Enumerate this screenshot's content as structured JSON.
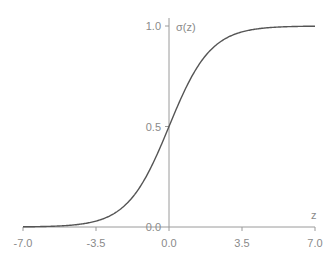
{
  "chart_data": {
    "type": "line",
    "title": "",
    "xlabel": "z",
    "ylabel": "σ(z)",
    "function": "sigmoid: 1/(1+e^-z)",
    "xlim": [
      -7.0,
      7.0
    ],
    "ylim": [
      0.0,
      1.0
    ],
    "x_ticks": [
      "-7.0",
      "-3.5",
      "0.0",
      "3.5",
      "7.0"
    ],
    "y_ticks": [
      "0.0",
      "0.5",
      "1.0"
    ],
    "grid": false,
    "legend": null,
    "series": [
      {
        "name": "σ(z)",
        "x": [
          -7.0,
          -6.0,
          -5.0,
          -4.0,
          -3.5,
          -3.0,
          -2.0,
          -1.0,
          0.0,
          1.0,
          2.0,
          3.0,
          3.5,
          4.0,
          5.0,
          6.0,
          7.0
        ],
        "values": [
          0.001,
          0.002,
          0.007,
          0.018,
          0.029,
          0.047,
          0.119,
          0.269,
          0.5,
          0.731,
          0.881,
          0.953,
          0.971,
          0.982,
          0.993,
          0.998,
          0.999
        ]
      }
    ],
    "colors": {
      "curve": "#555555",
      "axis": "#9a9a9a",
      "text": "#8a8a8a"
    }
  }
}
